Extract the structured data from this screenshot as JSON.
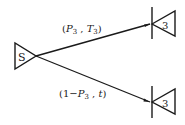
{
  "diagram": {
    "type": "decision-tree",
    "nodes": {
      "source": {
        "label": "S"
      },
      "upper": {
        "label": "3"
      },
      "lower": {
        "label": "3"
      }
    },
    "edges": {
      "upper": {
        "open": "(",
        "p": "P",
        "p_sub": "3",
        "sep": " , ",
        "t": "T",
        "t_sub": "3",
        "close": ")"
      },
      "lower": {
        "open": "(1−",
        "p": "P",
        "p_sub": "3",
        "sep": " , ",
        "t": "t",
        "close": ")"
      }
    },
    "colors": {
      "stroke": "#1a1a1a",
      "background": "#ffffff"
    }
  }
}
